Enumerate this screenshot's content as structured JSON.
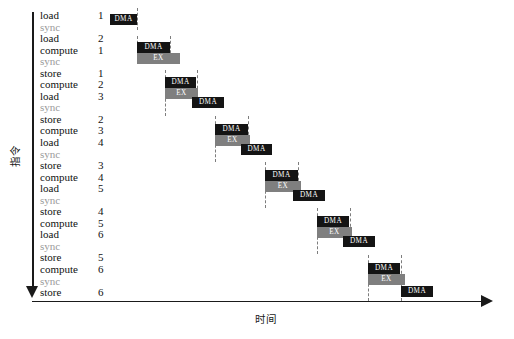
{
  "axes": {
    "y_label": "指令",
    "x_label": "时间"
  },
  "chart_data": {
    "type": "bar",
    "title": "",
    "xlabel": "时间",
    "ylabel": "指令",
    "grid": false,
    "legend": "none",
    "note": "Software-pipelined DMA/EX timeline; rows are instructions, horizontal position is time.",
    "instructions": [
      {
        "op": "load",
        "num": "1"
      },
      {
        "op": "sync",
        "num": ""
      },
      {
        "op": "load",
        "num": "2"
      },
      {
        "op": "compute",
        "num": "1"
      },
      {
        "op": "sync",
        "num": ""
      },
      {
        "op": "store",
        "num": "1"
      },
      {
        "op": "compute",
        "num": "2"
      },
      {
        "op": "load",
        "num": "3"
      },
      {
        "op": "sync",
        "num": ""
      },
      {
        "op": "store",
        "num": "2"
      },
      {
        "op": "compute",
        "num": "3"
      },
      {
        "op": "load",
        "num": "4"
      },
      {
        "op": "sync",
        "num": ""
      },
      {
        "op": "store",
        "num": "3"
      },
      {
        "op": "compute",
        "num": "4"
      },
      {
        "op": "load",
        "num": "5"
      },
      {
        "op": "sync",
        "num": ""
      },
      {
        "op": "store",
        "num": "4"
      },
      {
        "op": "compute",
        "num": "5"
      },
      {
        "op": "load",
        "num": "6"
      },
      {
        "op": "sync",
        "num": ""
      },
      {
        "op": "store",
        "num": "5"
      },
      {
        "op": "compute",
        "num": "6"
      },
      {
        "op": "sync",
        "num": ""
      },
      {
        "op": "store",
        "num": "6"
      }
    ],
    "colors": {
      "dma": "#141414",
      "ex": "#7f7f7f",
      "dash": "#7d7d7d",
      "axis": "#1a1a1a",
      "sync_text": "#9a9a9a"
    },
    "bar_label_dma": "DMA",
    "bar_label_ex": "EX",
    "bars": [
      {
        "label": "DMA",
        "kind": "dma",
        "x": 110,
        "y": 14,
        "w": 27
      },
      {
        "label": "DMA",
        "kind": "dma",
        "x": 137,
        "y": 42,
        "w": 33
      },
      {
        "label": "EX",
        "kind": "ex",
        "x": 137,
        "y": 53,
        "w": 43
      },
      {
        "label": "DMA",
        "kind": "dma",
        "x": 165,
        "y": 77,
        "w": 31
      },
      {
        "label": "EX",
        "kind": "ex",
        "x": 165,
        "y": 88,
        "w": 33
      },
      {
        "label": "DMA",
        "kind": "dma",
        "x": 192,
        "y": 97,
        "w": 32
      },
      {
        "label": "DMA",
        "kind": "dma",
        "x": 215,
        "y": 124,
        "w": 33
      },
      {
        "label": "EX",
        "kind": "ex",
        "x": 215,
        "y": 135,
        "w": 35
      },
      {
        "label": "DMA",
        "kind": "dma",
        "x": 241,
        "y": 144,
        "w": 31
      },
      {
        "label": "DMA",
        "kind": "dma",
        "x": 265,
        "y": 170,
        "w": 33
      },
      {
        "label": "EX",
        "kind": "ex",
        "x": 265,
        "y": 181,
        "w": 36
      },
      {
        "label": "DMA",
        "kind": "dma",
        "x": 293,
        "y": 190,
        "w": 32
      },
      {
        "label": "DMA",
        "kind": "dma",
        "x": 317,
        "y": 216,
        "w": 32
      },
      {
        "label": "EX",
        "kind": "ex",
        "x": 317,
        "y": 227,
        "w": 35
      },
      {
        "label": "DMA",
        "kind": "dma",
        "x": 343,
        "y": 236,
        "w": 32
      },
      {
        "label": "DMA",
        "kind": "dma",
        "x": 368,
        "y": 263,
        "w": 32
      },
      {
        "label": "EX",
        "kind": "ex",
        "x": 368,
        "y": 274,
        "w": 37
      },
      {
        "label": "DMA",
        "kind": "dma",
        "x": 401,
        "y": 286,
        "w": 32
      }
    ],
    "dashes": [
      {
        "x": 136.5,
        "y": 8,
        "h": 22
      },
      {
        "x": 136.5,
        "y": 36,
        "h": 22
      },
      {
        "x": 169.5,
        "y": 36,
        "h": 22
      },
      {
        "x": 164.5,
        "y": 70,
        "h": 24
      },
      {
        "x": 196.5,
        "y": 70,
        "h": 24
      },
      {
        "x": 164.5,
        "y": 94,
        "h": 22
      },
      {
        "x": 214.5,
        "y": 116,
        "h": 24
      },
      {
        "x": 247.5,
        "y": 116,
        "h": 24
      },
      {
        "x": 214.5,
        "y": 140,
        "h": 22
      },
      {
        "x": 264.5,
        "y": 162,
        "h": 24
      },
      {
        "x": 297.5,
        "y": 162,
        "h": 24
      },
      {
        "x": 264.5,
        "y": 186,
        "h": 22
      },
      {
        "x": 316.5,
        "y": 208,
        "h": 24
      },
      {
        "x": 349.5,
        "y": 208,
        "h": 24
      },
      {
        "x": 316.5,
        "y": 232,
        "h": 22
      },
      {
        "x": 367.5,
        "y": 255,
        "h": 24
      },
      {
        "x": 400.5,
        "y": 255,
        "h": 24
      },
      {
        "x": 367.5,
        "y": 279,
        "h": 22
      },
      {
        "x": 400.5,
        "y": 279,
        "h": 22
      }
    ]
  }
}
